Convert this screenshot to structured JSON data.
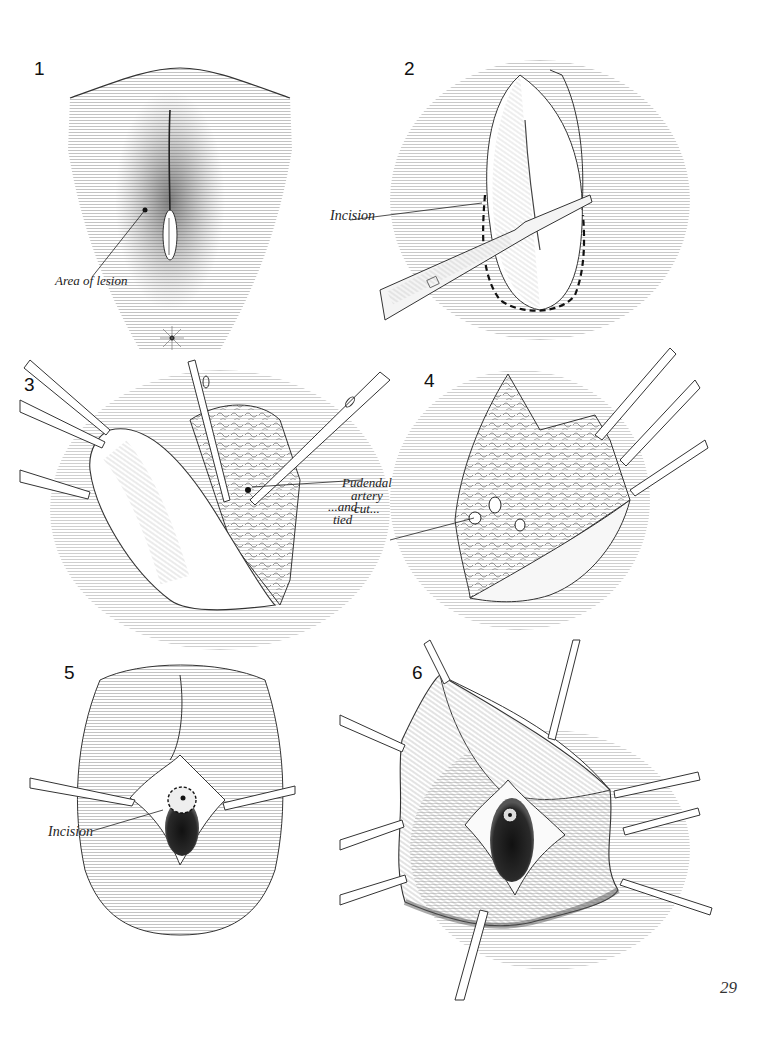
{
  "page": {
    "page_number": "29"
  },
  "figures": [
    {
      "number": "1",
      "labels": [
        "Area of lesion"
      ]
    },
    {
      "number": "2",
      "labels": [
        "Incision"
      ]
    },
    {
      "number": "3",
      "labels": [
        "Pudendal",
        "artery",
        "cut..."
      ]
    },
    {
      "number": "4",
      "labels": [
        "...and",
        "tied"
      ]
    },
    {
      "number": "5",
      "labels": [
        "Incision"
      ]
    },
    {
      "number": "6",
      "labels": []
    }
  ],
  "colors": {
    "ink": "#1a1a1a",
    "paper": "#ffffff",
    "hatch": "#8a8a8a"
  }
}
